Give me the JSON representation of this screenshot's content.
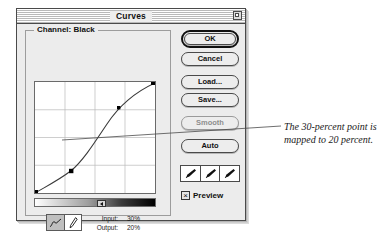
{
  "window": {
    "title": "Curves",
    "zoom_box_icon": "zoom-box-icon"
  },
  "graph_group": {
    "channel_label": "Channel: Black"
  },
  "curve_graph": {
    "grid_divisions": 4,
    "axis_note": "input horizontal, output vertical",
    "control_points": [
      {
        "name": "shadow-endpoint",
        "input_pct": 0,
        "output_pct": 0
      },
      {
        "name": "selected-point",
        "input_pct": 30,
        "output_pct": 20
      },
      {
        "name": "midtone-point",
        "input_pct": 70,
        "output_pct": 73
      },
      {
        "name": "highlight-endpoint",
        "input_pct": 100,
        "output_pct": 100
      }
    ]
  },
  "readout": {
    "input_label": "Input:",
    "input_value": "30%",
    "output_label": "Output:",
    "output_value": "20%"
  },
  "tools": {
    "curve_tool_icon": "curve-tool-icon",
    "pencil_tool_icon": "pencil-tool-icon",
    "selected": "curve-tool"
  },
  "ramp": {
    "marker_icon": "ramp-direction-marker"
  },
  "buttons": {
    "ok": "OK",
    "cancel": "Cancel",
    "load": "Load...",
    "save": "Save...",
    "smooth": "Smooth",
    "auto": "Auto"
  },
  "eyedroppers": [
    {
      "name": "black-point-eyedropper",
      "icon": "eyedropper-icon"
    },
    {
      "name": "gray-point-eyedropper",
      "icon": "eyedropper-icon"
    },
    {
      "name": "white-point-eyedropper",
      "icon": "eyedropper-icon"
    }
  ],
  "preview": {
    "label": "Preview",
    "checked_mark": "×"
  },
  "annotation": {
    "text": "The 30-percent point is mapped to 20 percent."
  },
  "colors": {
    "window_bg": "#ececec",
    "frame": "#4a4a4a",
    "graph_bg": "#ffffff",
    "text": "#111111",
    "disabled_text": "#8d8d8d"
  }
}
